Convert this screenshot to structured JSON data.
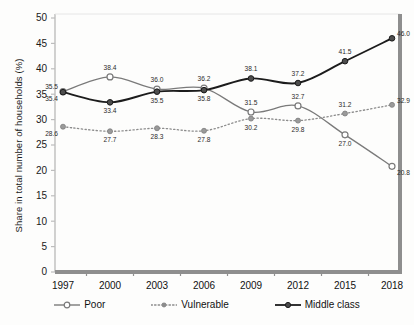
{
  "chart_data": {
    "type": "line",
    "title": "",
    "xlabel": "",
    "ylabel": "Share in total number of households (%)",
    "categories": [
      "1997",
      "2000",
      "2003",
      "2006",
      "2009",
      "2012",
      "2015",
      "2018"
    ],
    "ylim": [
      0,
      50
    ],
    "ytick_step": 5,
    "yticks": [
      "0",
      "5",
      "10",
      "15",
      "20",
      "25",
      "30",
      "35",
      "40",
      "45",
      "50"
    ],
    "grid": false,
    "legend_position": "bottom",
    "series": [
      {
        "name": "Poor",
        "color": "#7a7a7a",
        "line_style": "solid",
        "marker": "open-circle",
        "values": [
          35.5,
          38.4,
          36.0,
          36.2,
          31.5,
          32.7,
          27.0,
          20.8
        ],
        "labels": [
          "35.5",
          "38.4",
          "36.0",
          "36.2",
          "31.5",
          "32.7",
          "27.0",
          "20.8"
        ]
      },
      {
        "name": "Vulnerable",
        "color": "#8c8c8c",
        "line_style": "dotted",
        "marker": "small-filled-circle",
        "values": [
          28.6,
          27.7,
          28.3,
          27.8,
          30.2,
          29.8,
          31.2,
          32.9
        ],
        "labels": [
          "28.6",
          "27.7",
          "28.3",
          "27.8",
          "30.2",
          "29.8",
          "31.2",
          "32.9"
        ]
      },
      {
        "name": "Middle class",
        "color": "#1c1c1c",
        "line_style": "solid",
        "marker": "filled-circle",
        "values": [
          35.4,
          33.4,
          35.5,
          35.8,
          38.1,
          37.2,
          41.5,
          46.0
        ],
        "labels": [
          "35.4",
          "33.4",
          "35.5",
          "35.8",
          "38.1",
          "37.2",
          "41.5",
          "46.0"
        ]
      }
    ]
  },
  "legend": {
    "items": [
      {
        "label": "Poor"
      },
      {
        "label": "Vulnerable"
      },
      {
        "label": "Middle class"
      }
    ]
  },
  "background_artifacts": {
    "lines": [
      "         ",
      "         ",
      "       ",
      "         ",
      "     ",
      "       ",
      "     ",
      "       "
    ]
  }
}
